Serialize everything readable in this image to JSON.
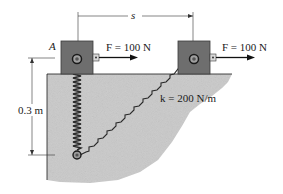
{
  "diagram": {
    "type": "mechanics-spring-collar",
    "labels": {
      "point_a": "A",
      "force_left": "F = 100 N",
      "force_right": "F = 100 N",
      "displacement": "s",
      "height": "0.3 m",
      "stiffness": "k = 200 N/m"
    },
    "colors": {
      "block": "#6b6b6b",
      "block_border": "#3a3a3a",
      "ground": "#c8c8c8",
      "line": "#1a1a1a",
      "background": "#ffffff"
    }
  }
}
